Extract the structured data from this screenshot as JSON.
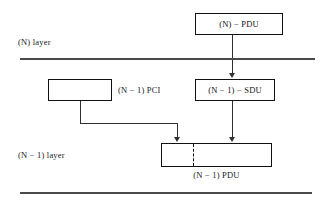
{
  "diagram": {
    "layers": [
      {
        "id": "n-layer",
        "label": "(N) layer"
      },
      {
        "id": "n-minus-1-layer",
        "label": "(N − 1) layer"
      }
    ],
    "boxes": [
      {
        "id": "n-pdu",
        "label": "(N)  −  PDU"
      },
      {
        "id": "n1-pci",
        "label": ""
      },
      {
        "id": "n1-sdu",
        "label": "(N − 1)  −  SDU"
      },
      {
        "id": "n1-pdu",
        "label": ""
      }
    ],
    "side_labels": [
      {
        "id": "pci-label",
        "label": "(N − 1) PCI"
      }
    ],
    "captions": [
      {
        "id": "pdu-caption",
        "label": "(N − 1) PDU"
      }
    ],
    "colors": {
      "background": "#ffffff",
      "box_border": "#111111",
      "rule": "#4a4a4a",
      "connector": "#303030",
      "text": "#1a1a1a"
    }
  }
}
